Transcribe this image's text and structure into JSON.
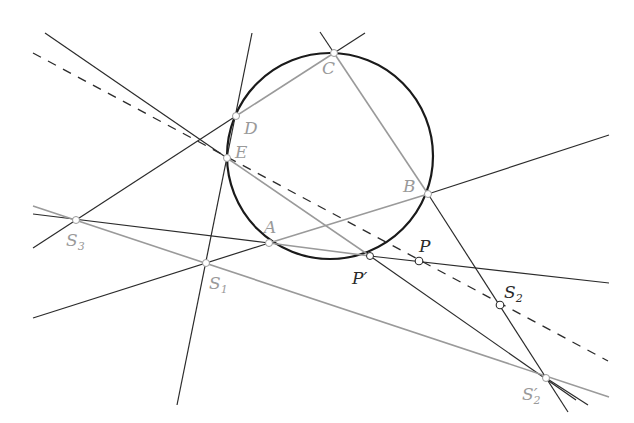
{
  "diagram": {
    "title": "",
    "colors": {
      "black_line": "#2b2b2b",
      "grey_line": "#9a9a9a",
      "circle": "#1a1a1a",
      "point_fill": "#ffffff",
      "grey_label": "#9a9a9a",
      "dark_label": "#2a2a2a"
    },
    "circle": {
      "cx": 330,
      "cy": 156,
      "r": 103
    },
    "points": {
      "A": {
        "label": "A",
        "sub": "",
        "x": 269,
        "y": 243
      },
      "B": {
        "label": "B",
        "sub": "",
        "x": 428,
        "y": 194
      },
      "C": {
        "label": "C",
        "sub": "",
        "x": 334,
        "y": 53
      },
      "D": {
        "label": "D",
        "sub": "",
        "x": 236,
        "y": 116
      },
      "E": {
        "label": "E",
        "sub": "",
        "x": 227,
        "y": 158
      },
      "P": {
        "label": "P",
        "sub": "",
        "x": 419,
        "y": 261
      },
      "Pp": {
        "label": "P′",
        "sub": "",
        "x": 370,
        "y": 256
      },
      "S1": {
        "label": "S",
        "sub": "1",
        "x": 206,
        "y": 263
      },
      "S2": {
        "label": "S",
        "sub": "2",
        "x": 500,
        "y": 305
      },
      "S2p": {
        "label": "S′",
        "sub": "2",
        "x": 546,
        "y": 378
      },
      "S3": {
        "label": "S",
        "sub": "3",
        "x": 76,
        "y": 220
      }
    },
    "labels": {
      "A": "A",
      "B": "B",
      "C": "C",
      "D": "D",
      "E": "E",
      "P": "P",
      "P_prime": "P′",
      "S1": "S",
      "S1_sub": "1",
      "S2": "S",
      "S2_sub": "2",
      "S2_prime": "S′",
      "S2_prime_sub": "2",
      "S3": "S",
      "S3_sub": "3"
    }
  }
}
